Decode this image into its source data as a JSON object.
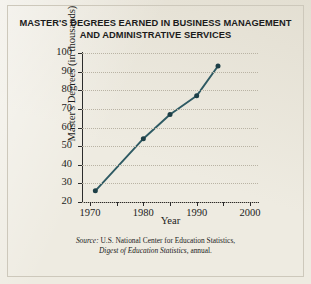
{
  "chart_data": {
    "type": "line",
    "title": "MASTER'S DEGREES EARNED IN BUSINESS MANAGEMENT AND ADMINISTRATIVE SERVICES",
    "title_line1": "MASTER'S DEGREES EARNED IN BUSINESS MANAGEMENT",
    "title_line2": "AND ADMINISTRATIVE SERVICES",
    "xlabel": "Year",
    "ylabel": "Master's Degrees (in thousands)",
    "xlim": [
      1968.5,
      2001.5
    ],
    "ylim": [
      20,
      100
    ],
    "grid": "horizontal-dotted",
    "legend": "none",
    "x": [
      1971,
      1980,
      1985,
      1990,
      1994
    ],
    "values": [
      26,
      54,
      67,
      77,
      93
    ],
    "series": [
      {
        "name": "Master's degrees in business management and administrative services",
        "x": [
          1971,
          1980,
          1985,
          1990,
          1994
        ],
        "values": [
          26,
          54,
          67,
          77,
          93
        ]
      }
    ],
    "yticks": [
      20,
      30,
      40,
      50,
      60,
      70,
      80,
      90,
      100
    ],
    "ytick_labels": [
      "20",
      "30",
      "40",
      "50",
      "60",
      "70",
      "80",
      "90",
      "100"
    ],
    "xticks": [
      1970,
      1975,
      1980,
      1985,
      1990,
      1995,
      2000
    ],
    "xtick_labels": [
      "1970",
      "",
      "1980",
      "",
      "1990",
      "",
      "2000"
    ],
    "xtick_major": [
      1970,
      1980,
      1990,
      2000
    ],
    "line_color": "#2e5a63",
    "marker_color": "#1d3f47",
    "grid_color": "#b9b3a4",
    "axis_color": "#2c2c2c"
  },
  "source": {
    "prefix": "Source:",
    "line1": " U.S. National Center for Education Statistics,",
    "line2": "Digest of Education Statistics,",
    "line2_suffix": " annual."
  }
}
